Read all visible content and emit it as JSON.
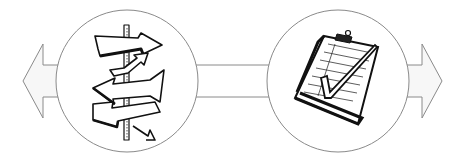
{
  "diagram": {
    "type": "process-flow",
    "background": "#ffffff",
    "stroke_color": "#8a8a8a",
    "ink_color": "#111111",
    "arrow_fill": "#f7f7f7",
    "nodes": [
      {
        "id": "left-node",
        "icon": "signpost-arrows-icon",
        "meaning": "multiple directions / decision",
        "cx": 127,
        "cy": 81,
        "r": 72
      },
      {
        "id": "right-node",
        "icon": "clipboard-checkmark-icon",
        "meaning": "checklist / completed",
        "cx": 338,
        "cy": 81,
        "r": 72
      }
    ],
    "connector": {
      "from": "left-node",
      "to": "right-node",
      "y_top": 65,
      "y_bottom": 97
    },
    "outer_arrows": [
      {
        "id": "left-arrow",
        "direction": "left",
        "tip_x": 23,
        "base_x": 43
      },
      {
        "id": "right-arrow",
        "direction": "right",
        "tip_x": 442,
        "base_x": 422
      }
    ]
  }
}
